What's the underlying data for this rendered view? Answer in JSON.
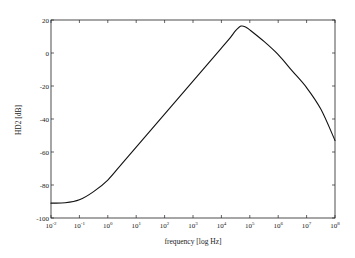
{
  "chart_data": {
    "type": "line",
    "title": "",
    "xlabel": "frequency [log Hz]",
    "ylabel": "HD2 [dB]",
    "xscale": "log",
    "xlim": [
      0.01,
      100000000
    ],
    "ylim": [
      -100,
      20
    ],
    "grid": false,
    "legend": null,
    "x_ticks": [
      {
        "value": -2,
        "label": "10",
        "exp": "-2"
      },
      {
        "value": -1,
        "label": "10",
        "exp": "-1"
      },
      {
        "value": 0,
        "label": "10",
        "exp": "0"
      },
      {
        "value": 1,
        "label": "10",
        "exp": "1"
      },
      {
        "value": 2,
        "label": "10",
        "exp": "2"
      },
      {
        "value": 3,
        "label": "10",
        "exp": "3"
      },
      {
        "value": 4,
        "label": "10",
        "exp": "4"
      },
      {
        "value": 5,
        "label": "10",
        "exp": "5"
      },
      {
        "value": 6,
        "label": "10",
        "exp": "6"
      },
      {
        "value": 7,
        "label": "10",
        "exp": "7"
      },
      {
        "value": 8,
        "label": "10",
        "exp": "8"
      }
    ],
    "y_ticks": [
      20,
      0,
      -20,
      -40,
      -60,
      -80,
      -100
    ],
    "series": [
      {
        "name": "HD2",
        "color": "#111111",
        "log10_x": [
          -2,
          -1.5,
          -1,
          -0.5,
          0,
          0.5,
          1,
          1.5,
          2,
          2.5,
          3,
          3.5,
          4,
          4.3,
          4.5,
          4.69,
          4.85,
          5,
          5.5,
          6,
          6.5,
          7,
          7.5,
          8
        ],
        "y": [
          -91,
          -90.8,
          -89,
          -84,
          -77,
          -67,
          -57,
          -47,
          -37,
          -27,
          -17,
          -7,
          3,
          9,
          13.5,
          16.3,
          15.8,
          14,
          7,
          -1,
          -11,
          -21,
          -34,
          -53
        ]
      }
    ]
  }
}
